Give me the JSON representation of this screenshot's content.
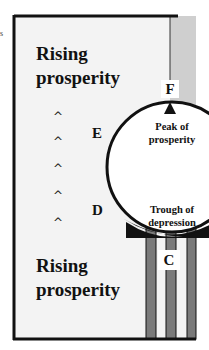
{
  "stray_text": "s",
  "colors": {
    "frame": "#111111",
    "panel_bg": "#f3f3f3",
    "gray_strip": "#cfcfcf",
    "bar_gray": "#7a7a7a",
    "circle_fill": "#ffffff"
  },
  "labels": {
    "top_region": "Rising prosperity",
    "top_region_line1": "Rising",
    "top_region_line2": "prosperity",
    "bottom_region_line1": "Rising",
    "bottom_region_line2": "prosperity",
    "point_f": "F",
    "point_e": "E",
    "point_d": "D",
    "point_c": "C",
    "peak_line1": "Peak of",
    "peak_line2": "prosperity",
    "trough_line1": "Trough of",
    "trough_line2": "depression"
  },
  "arrows": {
    "glyph": "^",
    "count": 5
  }
}
